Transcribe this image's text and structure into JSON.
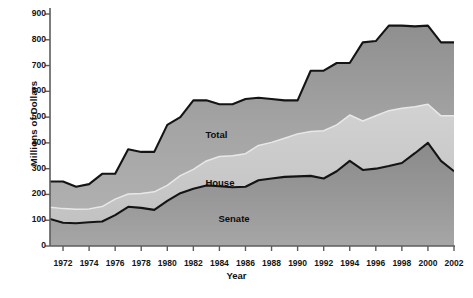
{
  "chart_data": {
    "type": "area",
    "stacked": true,
    "title": "",
    "xlabel": "Year",
    "ylabel": "Millions of Dollars",
    "xlim": [
      1971,
      2002
    ],
    "ylim": [
      0,
      900
    ],
    "yticks": [
      0,
      100,
      200,
      300,
      400,
      500,
      600,
      700,
      800,
      900
    ],
    "xticks": [
      1972,
      1974,
      1976,
      1978,
      1980,
      1982,
      1984,
      1986,
      1988,
      1990,
      1992,
      1994,
      1996,
      1998,
      2000,
      2002
    ],
    "grid": false,
    "legend": "in-plot labels",
    "x": [
      1971,
      1972,
      1973,
      1974,
      1975,
      1976,
      1977,
      1978,
      1979,
      1980,
      1981,
      1982,
      1983,
      1984,
      1985,
      1986,
      1987,
      1988,
      1989,
      1990,
      1991,
      1992,
      1993,
      1994,
      1995,
      1996,
      1997,
      1998,
      1999,
      2000,
      2001,
      2002
    ],
    "series": [
      {
        "name": "Senate",
        "color": "#8b8b8b",
        "values": [
          105,
          90,
          88,
          92,
          95,
          120,
          152,
          148,
          140,
          175,
          205,
          222,
          235,
          232,
          228,
          230,
          255,
          262,
          268,
          270,
          272,
          262,
          290,
          330,
          295,
          300,
          310,
          322,
          360,
          400,
          330,
          290
        ]
      },
      {
        "name": "House",
        "color": "#c9c9c9",
        "values": [
          45,
          55,
          55,
          52,
          58,
          62,
          50,
          56,
          70,
          60,
          68,
          75,
          95,
          115,
          122,
          128,
          135,
          140,
          150,
          165,
          172,
          185,
          180,
          178,
          190,
          205,
          215,
          212,
          180,
          150,
          175,
          215
        ]
      },
      {
        "name": "Total",
        "color": "#9e9e9e",
        "values": [
          100,
          105,
          87,
          96,
          127,
          98,
          173,
          161,
          155,
          235,
          227,
          268,
          235,
          203,
          200,
          212,
          185,
          168,
          147,
          130,
          236,
          233,
          240,
          202,
          305,
          290,
          330,
          321,
          312,
          305,
          285,
          285
        ]
      }
    ],
    "cumulative": {
      "senate": [
        105,
        90,
        88,
        92,
        95,
        120,
        152,
        148,
        140,
        175,
        205,
        222,
        235,
        232,
        228,
        230,
        255,
        262,
        268,
        270,
        272,
        262,
        290,
        330,
        295,
        300,
        310,
        322,
        360,
        400,
        330,
        290
      ],
      "house": [
        150,
        145,
        143,
        144,
        153,
        182,
        202,
        204,
        210,
        235,
        273,
        297,
        330,
        347,
        350,
        358,
        390,
        402,
        418,
        435,
        444,
        447,
        470,
        508,
        485,
        505,
        525,
        534,
        540,
        550,
        505,
        505
      ],
      "total": [
        250,
        250,
        230,
        240,
        280,
        280,
        375,
        365,
        365,
        470,
        500,
        565,
        565,
        550,
        550,
        570,
        575,
        570,
        565,
        565,
        680,
        680,
        710,
        710,
        790,
        795,
        855,
        855,
        852,
        855,
        790,
        790
      ]
    },
    "annotations": [
      {
        "text": "Total",
        "x": 1984,
        "y": 430
      },
      {
        "text": "House",
        "x": 1984,
        "y": 245
      },
      {
        "text": "Senate",
        "x": 1985,
        "y": 105
      }
    ]
  },
  "axis": {
    "ylabel": "Millions of Dollars",
    "xlabel": "Year",
    "yticks": [
      "900",
      "800",
      "700",
      "600",
      "500",
      "400",
      "300",
      "200",
      "100",
      "0"
    ],
    "xticks": [
      "1972",
      "1974",
      "1976",
      "1978",
      "1980",
      "1982",
      "1984",
      "1986",
      "1988",
      "1990",
      "1992",
      "1994",
      "1996",
      "1998",
      "2000",
      "2002"
    ]
  },
  "labels": {
    "total": "Total",
    "house": "House",
    "senate": "Senate"
  },
  "colors": {
    "senate_fill": "#8e8e8e",
    "house_fill": "#c8c8c8",
    "total_fill": "#9d9d9d",
    "outline": "#1a1a1a",
    "text": "#111111",
    "axis": "#5a5a5a"
  }
}
